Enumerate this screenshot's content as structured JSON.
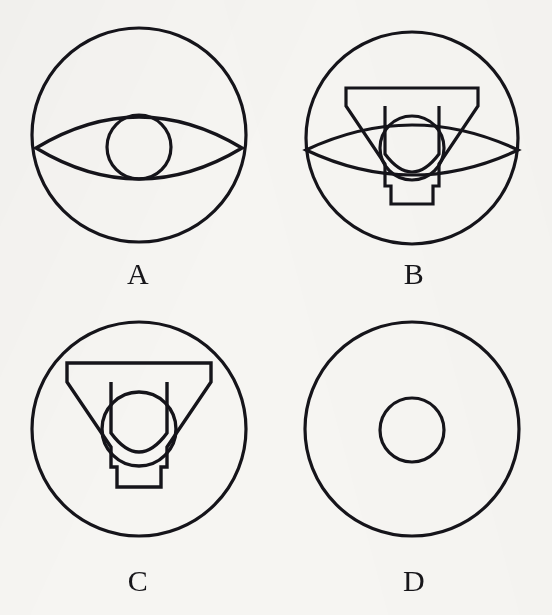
{
  "figure": {
    "background_color": "#f6f5f2",
    "stroke_color": "#15141a",
    "stroke_width": 3,
    "columns": 2,
    "rows": 2,
    "panel_count": 4
  },
  "panels": [
    {
      "id": "A",
      "label": "A",
      "position": "top-left",
      "shapes": [
        {
          "name": "outer-circle",
          "type": "circle",
          "cx": 139,
          "cy": 131,
          "r": 107
        },
        {
          "name": "lens-eye",
          "type": "lens",
          "cx": 139,
          "cy": 144,
          "half_width": 103,
          "half_height": 30
        },
        {
          "name": "inner-circle",
          "type": "circle",
          "cx": 139,
          "cy": 143,
          "r": 32
        }
      ]
    },
    {
      "id": "B",
      "label": "B",
      "position": "top-right",
      "shapes": [
        {
          "name": "outer-circle",
          "type": "circle",
          "cx": 136,
          "cy": 134,
          "r": 106
        },
        {
          "name": "lens-eye",
          "type": "lens",
          "cx": 136,
          "cy": 146,
          "half_width": 106,
          "half_height": 40
        },
        {
          "name": "y-trophy",
          "type": "y-shape",
          "cx": 136,
          "cy": 142,
          "top_y": 84,
          "bottom_y": 200,
          "half_width": 66,
          "stem_half_width": 21,
          "bar_height": 18
        },
        {
          "name": "inner-circle",
          "type": "circle",
          "cx": 136,
          "cy": 144,
          "r": 32
        }
      ]
    },
    {
      "id": "C",
      "label": "C",
      "position": "bottom-left",
      "shapes": [
        {
          "name": "outer-circle",
          "type": "circle",
          "cx": 139,
          "cy": 118,
          "r": 107
        },
        {
          "name": "y-trophy",
          "type": "y-shape",
          "cx": 139,
          "cy": 124,
          "top_y": 52,
          "bottom_y": 176,
          "half_width": 72,
          "stem_half_width": 23,
          "bar_height": 19
        },
        {
          "name": "inner-circle",
          "type": "circle",
          "cx": 139,
          "cy": 118,
          "r": 37
        }
      ]
    },
    {
      "id": "D",
      "label": "D",
      "position": "bottom-right",
      "shapes": [
        {
          "name": "outer-circle",
          "type": "circle",
          "cx": 136,
          "cy": 118,
          "r": 107
        },
        {
          "name": "inner-circle",
          "type": "circle",
          "cx": 136,
          "cy": 119,
          "r": 32
        }
      ]
    }
  ]
}
